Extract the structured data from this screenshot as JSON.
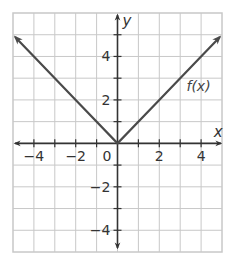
{
  "chart_data": {
    "type": "line",
    "title": "",
    "xlabel": "x",
    "ylabel": "y",
    "xlim": [
      -5,
      5
    ],
    "ylim": [
      -5,
      6
    ],
    "grid": true,
    "grid_step": 1,
    "x_tick_labels": [
      {
        "value": -4,
        "label": "−4"
      },
      {
        "value": -2,
        "label": "−2"
      },
      {
        "value": 2,
        "label": "2"
      },
      {
        "value": 4,
        "label": "4"
      }
    ],
    "y_tick_labels": [
      {
        "value": 4,
        "label": "4"
      },
      {
        "value": 2,
        "label": "2"
      },
      {
        "value": -2,
        "label": "−2"
      },
      {
        "value": -4,
        "label": "−4"
      }
    ],
    "origin_label": "0",
    "series": [
      {
        "name": "f(x)",
        "description": "absolute value function, both ends arrowed",
        "x": [
          -4.9,
          -4,
          -2,
          0,
          2,
          4,
          4.9
        ],
        "y": [
          4.9,
          4,
          2,
          0,
          2,
          4,
          4.9
        ]
      }
    ],
    "annotations": [
      {
        "text": "f(x)",
        "x": 3.3,
        "y": 2.4
      }
    ]
  },
  "colors": {
    "grid": "#c8c8c8",
    "axis": "#333333",
    "function": "#4a4a4a"
  }
}
